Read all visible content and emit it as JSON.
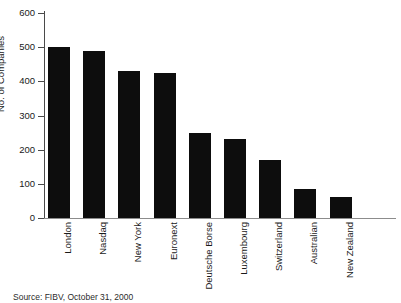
{
  "chart_data": {
    "type": "bar",
    "title": "",
    "subtitle": "",
    "xlabel": "",
    "ylabel": "No. of Companies",
    "ylim": [
      0,
      600
    ],
    "ytick_labels": [
      "0",
      "100",
      "200",
      "300",
      "400",
      "500",
      "600"
    ],
    "ytick_values": [
      0,
      100,
      200,
      300,
      400,
      500,
      600
    ],
    "grid": false,
    "legend": false,
    "orientation": "vertical",
    "bar_color": "#0d0d0d",
    "categories": [
      "London",
      "Nasdaq",
      "New York",
      "Euronext",
      "Deutsche Borse",
      "Luxembourg",
      "Switzerland",
      "Australian",
      "New Zealand"
    ],
    "values": [
      500,
      490,
      430,
      425,
      250,
      230,
      170,
      85,
      62
    ],
    "annotations": []
  },
  "axes": {
    "y_title": "No. of Companies",
    "ticks": [
      {
        "label": "600",
        "value": 600
      },
      {
        "label": "500",
        "value": 500
      },
      {
        "label": "400",
        "value": 400
      },
      {
        "label": "300",
        "value": 300
      },
      {
        "label": "200",
        "value": 200
      },
      {
        "label": "100",
        "value": 100
      },
      {
        "label": "0",
        "value": 0
      }
    ]
  },
  "footer": {
    "source": "Source: FIBV, October 31, 2000"
  },
  "colors": {
    "bar": "#0d0d0d",
    "axis": "#4a4a4a",
    "text": "#1a1a1a",
    "background": "#ffffff"
  }
}
